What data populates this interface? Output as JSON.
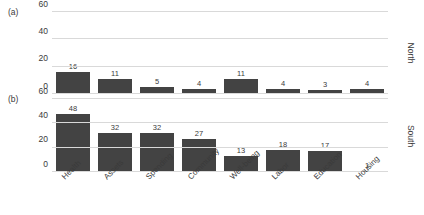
{
  "chart_data": {
    "type": "bar",
    "title": "",
    "xlabel": "",
    "ylabel": "",
    "ylim": [
      0,
      60
    ],
    "yticks": [
      0,
      20,
      40,
      60
    ],
    "grid": "horizontal",
    "legend": "none",
    "bar_color": "#434343",
    "grid_color": "#d9d9d9",
    "categories": [
      "Health",
      "Assets",
      "Spending",
      "Community",
      "Well-being",
      "Labor",
      "Education",
      "Housing"
    ],
    "panels": [
      {
        "letter": "(a)",
        "side_label": "North",
        "values": [
          16,
          11,
          5,
          4,
          11,
          4,
          3,
          4
        ]
      },
      {
        "letter": "(b)",
        "side_label": "South",
        "values": [
          48,
          32,
          32,
          27,
          13,
          18,
          17,
          1
        ]
      }
    ]
  }
}
